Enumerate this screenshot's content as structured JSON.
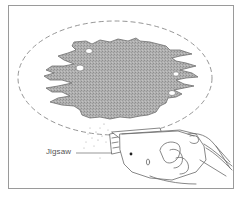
{
  "figure": {
    "frame": {
      "x": 8,
      "y": 5,
      "width": 225,
      "height": 183,
      "stroke": "#9a9a9a"
    },
    "cut_outline": {
      "shape": "dashed-ellipse",
      "cx": 115,
      "cy": 78,
      "rx": 97,
      "ry": 57,
      "stroke": "#8a8a8a"
    },
    "damaged_area": {
      "fill": "#a9a9a9",
      "edge": "#6f6f6f"
    },
    "tool": {
      "name": "jigsaw",
      "stroke": "#6a6a6a"
    },
    "colors": {
      "background": "#ffffff",
      "line": "#6a6a6a",
      "label": "#555555"
    }
  },
  "callouts": [
    {
      "label": "Jigsaw",
      "target": "jigsaw"
    }
  ]
}
